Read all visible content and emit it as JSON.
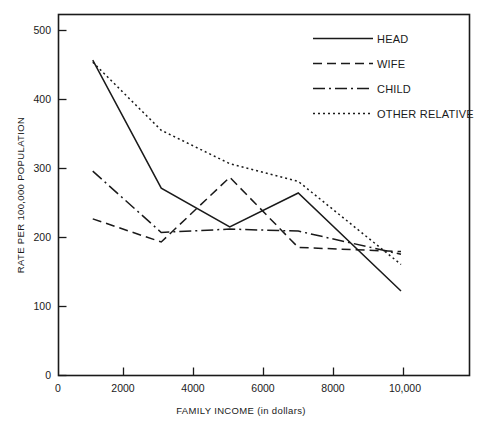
{
  "chart_data": {
    "type": "line",
    "title": "",
    "xlabel": "FAMILY INCOME (in dollars)",
    "ylabel": "RATE PER 100,000 POPULATION",
    "xlim": [
      0,
      12000
    ],
    "ylim": [
      0,
      530
    ],
    "grid": false,
    "legend_position": "top-right",
    "xticks": [
      0,
      2000,
      4000,
      6000,
      8000,
      10000
    ],
    "xtick_labels": [
      "0",
      "2000",
      "4000",
      "6000",
      "8000",
      "10,000"
    ],
    "yticks": [
      0,
      100,
      200,
      300,
      400,
      500
    ],
    "ytick_labels": [
      "0",
      "100",
      "200",
      "300",
      "400",
      "500"
    ],
    "x": [
      1000,
      3000,
      5000,
      7000,
      10000
    ],
    "series": [
      {
        "name": "HEAD",
        "style": "solid",
        "color": "#1a1a1a",
        "values": [
          463,
          275,
          218,
          268,
          124
        ]
      },
      {
        "name": "WIFE",
        "style": "dashed",
        "color": "#1a1a1a",
        "values": [
          230,
          196,
          291,
          188,
          182
        ]
      },
      {
        "name": "CHILD",
        "style": "dash-dot",
        "color": "#1a1a1a",
        "values": [
          300,
          210,
          215,
          212,
          178
        ]
      },
      {
        "name": "OTHER RELATIVE",
        "style": "dotted",
        "color": "#1a1a1a",
        "values": [
          460,
          360,
          311,
          285,
          163
        ]
      }
    ]
  },
  "legend": {
    "entries": [
      {
        "label": "HEAD",
        "style": "solid"
      },
      {
        "label": "WIFE",
        "style": "dashed"
      },
      {
        "label": "CHILD",
        "style": "dash-dot"
      },
      {
        "label": "OTHER RELATIVE",
        "style": "dotted"
      }
    ]
  }
}
